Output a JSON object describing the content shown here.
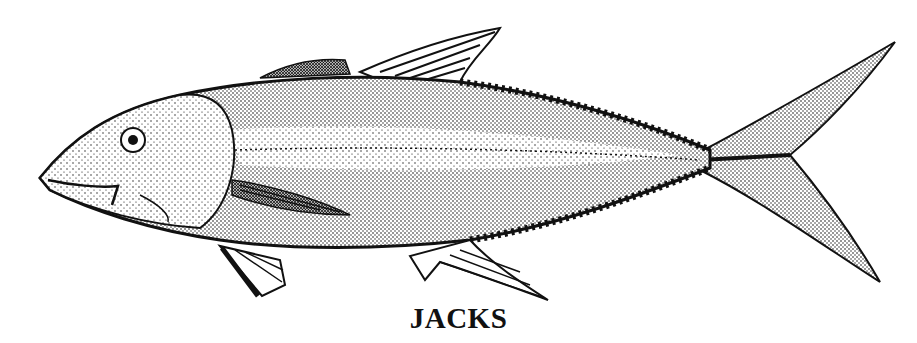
{
  "caption": "JACKS",
  "illustration": {
    "subject": "jack fish",
    "style": "stippled pen-and-ink drawing",
    "colors": {
      "ink": "#111111",
      "paper": "#ffffff"
    }
  }
}
